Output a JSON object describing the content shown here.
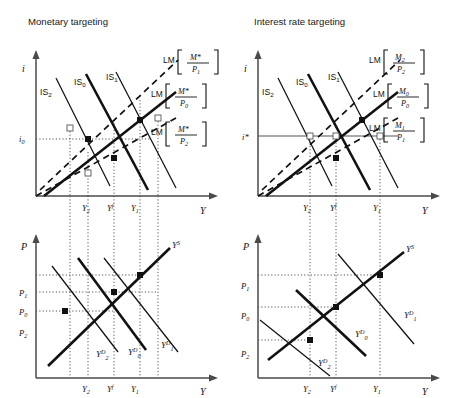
{
  "figure": {
    "type": "economics-diagram"
  },
  "panels": {
    "top_left": {
      "title": "Monetary targeting",
      "y_axis_label": "i",
      "x_axis_label": "Y",
      "y_ticks": [
        "i0"
      ],
      "x_ticks": [
        "Y2",
        "Yf",
        "Y1"
      ],
      "is_curves": [
        "IS2",
        "IS0",
        "IS1"
      ],
      "lm_labels": [
        {
          "name": "LM",
          "numerator": "M*",
          "denominator": "P1"
        },
        {
          "name": "LM",
          "numerator": "M*",
          "denominator": "P0"
        },
        {
          "name": "LM",
          "numerator": "M*",
          "denominator": "P2"
        }
      ]
    },
    "top_right": {
      "title": "Interest rate targeting",
      "y_axis_label": "i",
      "x_axis_label": "Y",
      "y_ticks": [
        "i*"
      ],
      "x_ticks": [
        "Y2",
        "Yf",
        "Y1"
      ],
      "is_curves": [
        "IS2",
        "IS0",
        "IS1"
      ],
      "lm_labels": [
        {
          "name": "LM",
          "numerator": "M2",
          "denominator": "P2"
        },
        {
          "name": "LM",
          "numerator": "M0",
          "denominator": "P0"
        },
        {
          "name": "LM",
          "numerator": "M1",
          "denominator": "P1"
        }
      ]
    },
    "bottom_left": {
      "y_axis_label": "P",
      "x_axis_label": "Y",
      "y_ticks": [
        "P1",
        "P0",
        "P2"
      ],
      "x_ticks": [
        "Y2",
        "Yf",
        "Y1"
      ],
      "supply_curve": "YS",
      "demand_curves": [
        "YD2",
        "YD0",
        "YD1"
      ]
    },
    "bottom_right": {
      "y_axis_label": "P",
      "x_axis_label": "Y",
      "y_ticks": [
        "P1",
        "P0",
        "P2"
      ],
      "x_ticks": [
        "Y2",
        "Yf",
        "Y1"
      ],
      "supply_curve": "YS",
      "demand_curves": [
        "YD2",
        "YD0",
        "YD1"
      ]
    }
  },
  "symbols": {
    "i": "i",
    "i0_base": "i",
    "i0_sub": "0",
    "istar_base": "i",
    "istar_sup": "*",
    "P": "P",
    "Y": "Y",
    "IS": "IS",
    "LM": "LM",
    "M": "M",
    "Mstar": "M*",
    "subscript_0": "0",
    "subscript_1": "1",
    "subscript_2": "2",
    "superscript_f": "f",
    "superscript_S": "S",
    "superscript_D": "D"
  },
  "colors": {
    "ink": "#111111",
    "axis": "#4a4a4a",
    "guide": "#555555",
    "background": "#ffffff"
  }
}
